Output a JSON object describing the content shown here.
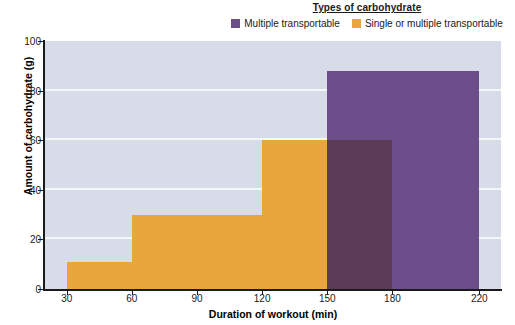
{
  "legend": {
    "title": "Types of carbohydrate",
    "entries": [
      {
        "label": "Multiple transportable",
        "color": "#6b4d89"
      },
      {
        "label": "Single or multiple transportable",
        "color": "#e9a63c"
      }
    ]
  },
  "chart_data": {
    "type": "bar",
    "title": "Types of carbohydrate",
    "xlabel": "Duration of workout (min)",
    "ylabel": "Amount of carbohydrate (g)",
    "xlim": [
      20,
      230
    ],
    "ylim": [
      0,
      100
    ],
    "xticks": [
      30,
      60,
      90,
      120,
      150,
      180,
      220
    ],
    "yticks": [
      0,
      20,
      40,
      60,
      80,
      100
    ],
    "grid": true,
    "legend_position": "top",
    "series": [
      {
        "name": "Single or multiple transportable",
        "color": "#e9a63c",
        "bars": [
          {
            "x_start": 30,
            "x_end": 60,
            "value": 11
          },
          {
            "x_start": 60,
            "x_end": 120,
            "value": 30
          },
          {
            "x_start": 120,
            "x_end": 180,
            "value": 60
          }
        ]
      },
      {
        "name": "Multiple transportable",
        "color": "#6b4d89",
        "bars": [
          {
            "x_start": 150,
            "x_end": 220,
            "value": 88
          }
        ]
      }
    ],
    "overlap_color": "#5b3a57",
    "plot_background": "#d8dce8",
    "gridline_color": "#f4f6fa"
  }
}
